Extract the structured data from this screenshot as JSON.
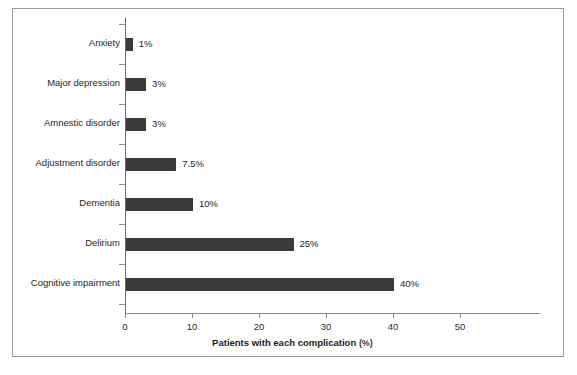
{
  "chart_data": {
    "type": "bar",
    "orientation": "horizontal",
    "title": "",
    "xlabel": "Patients with each complication",
    "xunit": "(%)",
    "ylabel": "",
    "xlim": [
      0,
      50
    ],
    "xticks": [
      0,
      10,
      20,
      30,
      40,
      50
    ],
    "xtick_labels": [
      "0",
      "10",
      "20",
      "30",
      "40",
      "50"
    ],
    "grid": false,
    "legend": null,
    "bar_color": "#3a3a3a",
    "categories": [
      "Anxiety",
      "Major depression",
      "Amnestic disorder",
      "Adjustment disorder",
      "Dementia",
      "Delirium",
      "Cognitive impairment"
    ],
    "values": [
      1,
      3,
      3,
      7.5,
      10,
      25,
      40
    ],
    "value_labels": [
      "1%",
      "3%",
      "3%",
      "7.5%",
      "10%",
      "25%",
      "40%"
    ]
  }
}
